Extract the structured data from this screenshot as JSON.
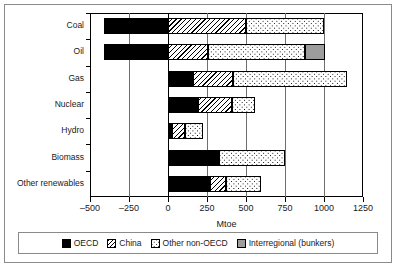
{
  "chart_data": {
    "type": "bar",
    "orientation": "horizontal",
    "stacked": true,
    "title": "",
    "subtitle": "",
    "xlabel": "Mtoe",
    "ylabel": "",
    "xlim": [
      -500,
      1250
    ],
    "xticks": [
      -500,
      -250,
      0,
      250,
      500,
      750,
      1000,
      1250
    ],
    "xtick_labels": [
      "–500",
      "–250",
      "0",
      "250",
      "500",
      "750",
      "1000",
      "1250"
    ],
    "grid": true,
    "grid_axis": "x",
    "legend_position": "bottom",
    "categories": [
      "Coal",
      "Oil",
      "Gas",
      "Nuclear",
      "Hydro",
      "Biomass",
      "Other renewables"
    ],
    "series": [
      {
        "name": "OECD",
        "color": "#000000",
        "pattern": "solid-black",
        "values": [
          -410,
          -410,
          160,
          195,
          25,
          325,
          270
        ]
      },
      {
        "name": "China",
        "color": "#ffffff",
        "pattern": "diagonal-hatch",
        "values": [
          500,
          255,
          255,
          215,
          85,
          0,
          100
        ]
      },
      {
        "name": "Other non-OECD",
        "color": "#ffffff",
        "pattern": "dots",
        "values": [
          500,
          625,
          735,
          145,
          115,
          425,
          225
        ]
      },
      {
        "name": "Interregional (bunkers)",
        "color": "#9d9d9d",
        "pattern": "solid-grey",
        "values": [
          0,
          125,
          0,
          0,
          0,
          0,
          0
        ]
      }
    ],
    "positive_totals": [
      1000,
      1005,
      1150,
      555,
      225,
      750,
      595
    ],
    "negative_totals": [
      -410,
      -410,
      0,
      0,
      0,
      0,
      0
    ]
  },
  "legend": {
    "items": [
      {
        "label": "OECD",
        "swatch": "oecd"
      },
      {
        "label": "China",
        "swatch": "china"
      },
      {
        "label": "Other non-OECD",
        "swatch": "other"
      },
      {
        "label": "Interregional (bunkers)",
        "swatch": "bunker"
      }
    ]
  }
}
